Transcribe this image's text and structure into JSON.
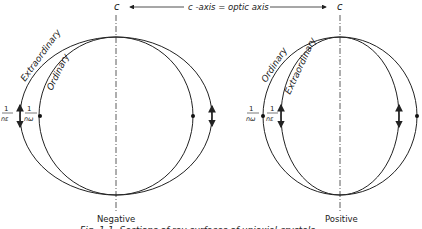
{
  "header": {
    "axis_label_left": "c",
    "axis_label_right": "c",
    "axis_caption": "c -axis = optic axis"
  },
  "figures": [
    {
      "name": "negative",
      "caption": "Negative",
      "outer_curve_label": "Extraordinary",
      "inner_curve_label": "Ordinary",
      "left_outer_fraction": {
        "num": "1",
        "den": "nε"
      },
      "left_inner_fraction": {
        "num": "1",
        "den": "nω"
      }
    },
    {
      "name": "positive",
      "caption": "Positive",
      "outer_curve_label": "Ordinary",
      "inner_curve_label": "Extraordinary",
      "left_outer_fraction": {
        "num": "1",
        "den": "nω"
      },
      "left_inner_fraction": {
        "num": "1",
        "den": "nε"
      }
    }
  ],
  "figure_caption": "Fig. 1-1. Sections of ray surfaces of uniaxial crystals."
}
